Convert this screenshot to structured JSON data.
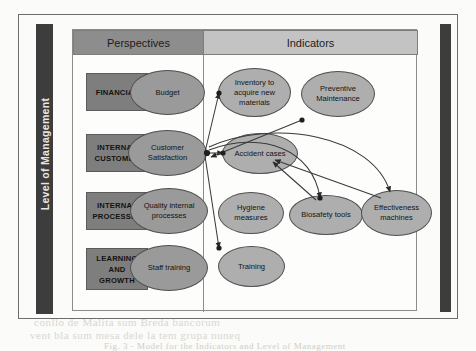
{
  "figure": {
    "axis_label_left": "Level of Management",
    "columns": [
      {
        "id": "perspectives",
        "label": "Perspectives"
      },
      {
        "id": "indicators",
        "label": "Indicators"
      }
    ],
    "perspectives": [
      {
        "id": "financial",
        "lines": [
          "FINANCIAL"
        ]
      },
      {
        "id": "internal-customer",
        "lines": [
          "INTERNAL",
          "CUSTOMER"
        ]
      },
      {
        "id": "internal-processes",
        "lines": [
          "INTERNAL",
          "PROCESSES"
        ]
      },
      {
        "id": "learning-and-growth",
        "lines": [
          "LEARNING",
          "AND",
          "GROWTH"
        ]
      }
    ],
    "perspective_ellipses": [
      {
        "id": "budget",
        "label": "Budget"
      },
      {
        "id": "customer-satisfaction",
        "label": "Customer Satisfaction"
      },
      {
        "id": "quality-internal-processes",
        "label": "Quality internal processes"
      },
      {
        "id": "staff-training",
        "label": "Staff training"
      }
    ],
    "indicator_ellipses": [
      {
        "id": "inventory-to-acquire-new-materials",
        "label": "Inventory to acquire new materials"
      },
      {
        "id": "preventive-maintenance",
        "label": "Preventive Maintenance"
      },
      {
        "id": "accident-cases",
        "label": "Accident cases"
      },
      {
        "id": "hygiene-measures",
        "label": "Hygiene measures"
      },
      {
        "id": "biosafety-tools",
        "label": "Biosafety tools"
      },
      {
        "id": "effectiveness-machines",
        "label": "Effectiveness machines"
      },
      {
        "id": "training",
        "label": "Training"
      }
    ],
    "connections": [
      {
        "from": "customer-satisfaction",
        "to": "inventory-to-acquire-new-materials"
      },
      {
        "from": "customer-satisfaction",
        "to": "accident-cases"
      },
      {
        "from": "customer-satisfaction",
        "to": "training"
      },
      {
        "from": "preventive-maintenance",
        "to": "customer-satisfaction"
      },
      {
        "from": "biosafety-tools",
        "to": "accident-cases"
      },
      {
        "from": "effectiveness-machines",
        "to": "accident-cases"
      },
      {
        "from": "customer-satisfaction",
        "to": "biosafety-tools"
      },
      {
        "from": "customer-satisfaction",
        "to": "effectiveness-machines"
      }
    ],
    "colors": {
      "header_perspectives": "#8d8d8d",
      "header_indicators": "#c3c3c3",
      "perspective_box": "#7e7e7e",
      "ellipse_fill": "#9a9a9a",
      "side_bar": "#3d3d3d",
      "frame": "#6d6d6d"
    },
    "ghost_lines": [
      {
        "text": "Hilo vario dele Indicatore dello Stocco",
        "x": 226,
        "y": 298,
        "size": 9
      },
      {
        "text": "conllo de Malita sum Breda bancorum",
        "x": 34,
        "y": 320,
        "size": 11
      },
      {
        "text": "vent bla sum mesa dele la tem grupa nuneq",
        "x": 30,
        "y": 333,
        "size": 11
      },
      {
        "text": "Fig. 3 - Model for the Indicators and Level of Management",
        "x": 104,
        "y": 344,
        "size": 9
      }
    ]
  }
}
